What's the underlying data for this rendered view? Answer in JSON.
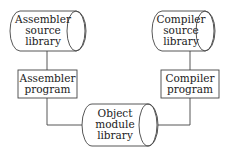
{
  "diagram": {
    "nodes": [
      {
        "id": "asm_src",
        "shape": "cylinder",
        "lines": [
          "Assembler",
          "source",
          "library"
        ]
      },
      {
        "id": "cmp_src",
        "shape": "cylinder",
        "lines": [
          "Compiler",
          "source",
          "library"
        ]
      },
      {
        "id": "asm_prog",
        "shape": "box",
        "lines": [
          "Assembler",
          "program"
        ]
      },
      {
        "id": "cmp_prog",
        "shape": "box",
        "lines": [
          "Compiler",
          "program"
        ]
      },
      {
        "id": "obj_lib",
        "shape": "cylinder",
        "lines": [
          "Object",
          "module",
          "library"
        ]
      }
    ],
    "edges": [
      {
        "from": "asm_src",
        "to": "asm_prog"
      },
      {
        "from": "cmp_src",
        "to": "cmp_prog"
      },
      {
        "from": "asm_prog",
        "to": "obj_lib"
      },
      {
        "from": "cmp_prog",
        "to": "obj_lib"
      }
    ],
    "colors": {
      "stroke": "#444444",
      "text": "#222222",
      "background": "#ffffff"
    }
  }
}
